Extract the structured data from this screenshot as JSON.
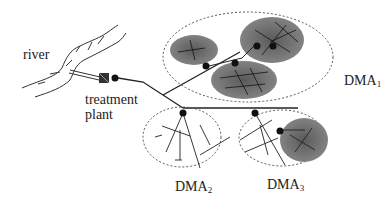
{
  "labels": {
    "river": "river",
    "treatment_line1": "treatment",
    "treatment_line2": "plant",
    "dma1": "DMA",
    "dma1_sub": "1",
    "dma2": "DMA",
    "dma2_sub": "2",
    "dma3": "DMA",
    "dma3_sub": "3"
  },
  "colors": {
    "line": "#222222",
    "zone_fill": "#6e6e6e",
    "dashed": "#555555"
  }
}
